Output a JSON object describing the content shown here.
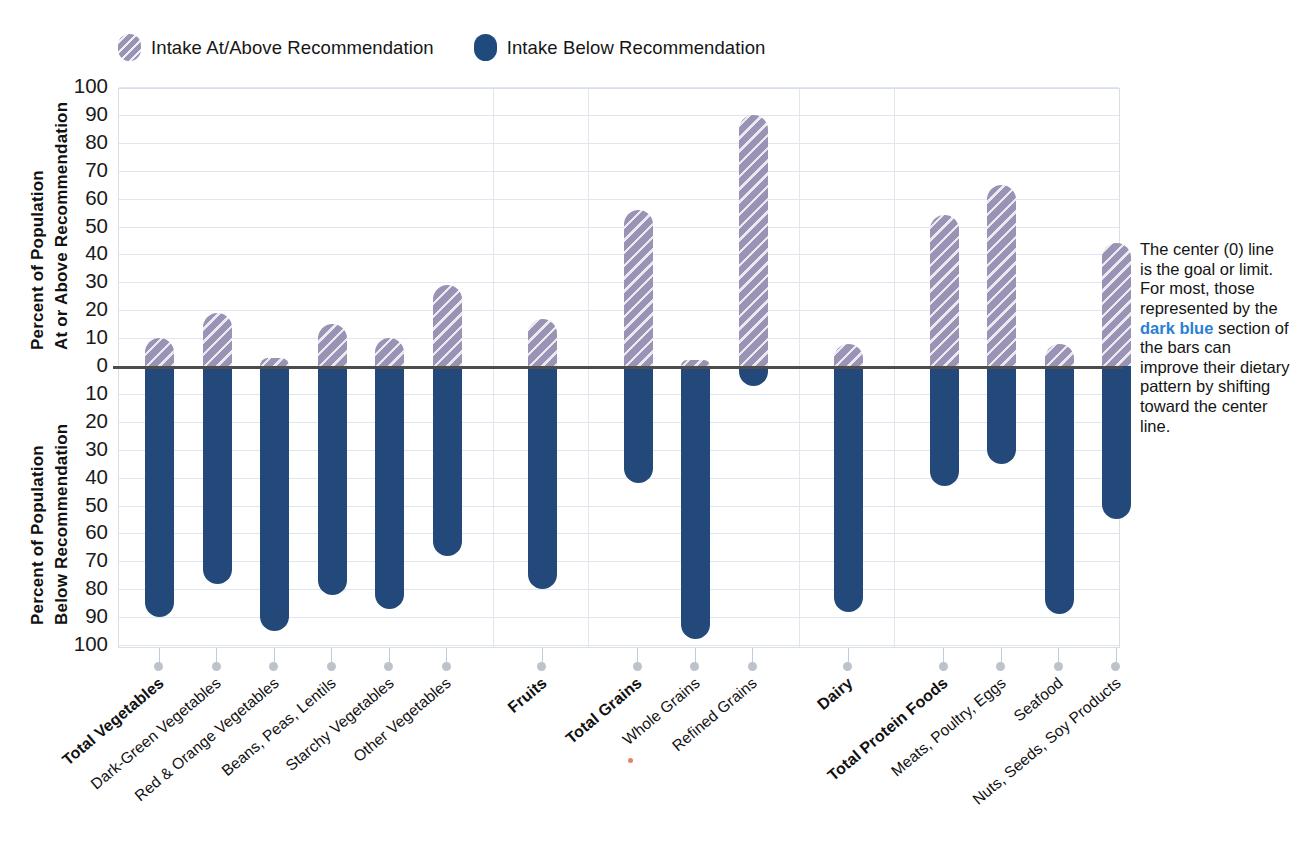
{
  "legend": {
    "items": [
      {
        "label": "Intake At/Above Recommendation",
        "swatch": "above",
        "color": "#9b93b5"
      },
      {
        "label": "Intake Below Recommendation",
        "swatch": "below",
        "color": "#1f4a7d"
      }
    ]
  },
  "axis": {
    "y_title_top_line1": "Percent of Population",
    "y_title_top_line2": "At or Above Recommendation",
    "y_title_bottom_line1": "Percent of Population",
    "y_title_bottom_line2": "Below Recommendation",
    "y_ticks_above": [
      "100",
      "90",
      "80",
      "70",
      "60",
      "50",
      "40",
      "30",
      "20",
      "10",
      "0"
    ],
    "y_ticks_below": [
      "10",
      "20",
      "30",
      "40",
      "50",
      "60",
      "70",
      "80",
      "90",
      "100"
    ]
  },
  "sidenote": {
    "before": "The center (0) line is the goal or limit. For most, those represented by the ",
    "highlight": "dark blue",
    "after": " section of the bars can improve their dietary pattern by shifting toward the center line."
  },
  "chart_data": {
    "type": "bar",
    "title": "",
    "subtitle": "",
    "xlabel": "",
    "ylabel": "Percent of Population",
    "ylim": [
      -100,
      100
    ],
    "grid": true,
    "legend_position": "top-left",
    "note": "Diverging bar chart. Positive (purple hatched) = intake at/above recommendation; negative (dark blue) = intake below recommendation. Each pair sums to 100%.",
    "categories": [
      "Total Vegetables",
      "Dark-Green Vegetables",
      "Red & Orange Vegetables",
      "Beans, Peas, Lentils",
      "Starchy Vegetables",
      "Other Vegetables",
      "Fruits",
      "Total Grains",
      "Whole Grains",
      "Refined Grains",
      "Dairy",
      "Total Protein Foods",
      "Meats, Poultry, Eggs",
      "Seafood",
      "Nuts, Seeds, Soy Products"
    ],
    "category_bold": [
      true,
      false,
      false,
      false,
      false,
      false,
      true,
      true,
      false,
      false,
      true,
      true,
      false,
      false,
      false
    ],
    "series": [
      {
        "name": "Intake At/Above Recommendation",
        "color": "#9b93b5",
        "values": [
          10,
          19,
          3,
          15,
          10,
          29,
          17,
          56,
          2,
          90,
          8,
          54,
          65,
          8,
          44
        ]
      },
      {
        "name": "Intake Below Recommendation",
        "color": "#1f4a7d",
        "values": [
          90,
          78,
          95,
          82,
          87,
          68,
          80,
          42,
          98,
          7,
          88,
          43,
          35,
          89,
          55
        ]
      }
    ],
    "groups": [
      {
        "name": "Vegetables",
        "start": 0,
        "end": 5
      },
      {
        "name": "Fruits",
        "start": 6,
        "end": 6
      },
      {
        "name": "Grains",
        "start": 7,
        "end": 9
      },
      {
        "name": "Dairy",
        "start": 10,
        "end": 10
      },
      {
        "name": "Protein Foods",
        "start": 11,
        "end": 14
      }
    ]
  }
}
